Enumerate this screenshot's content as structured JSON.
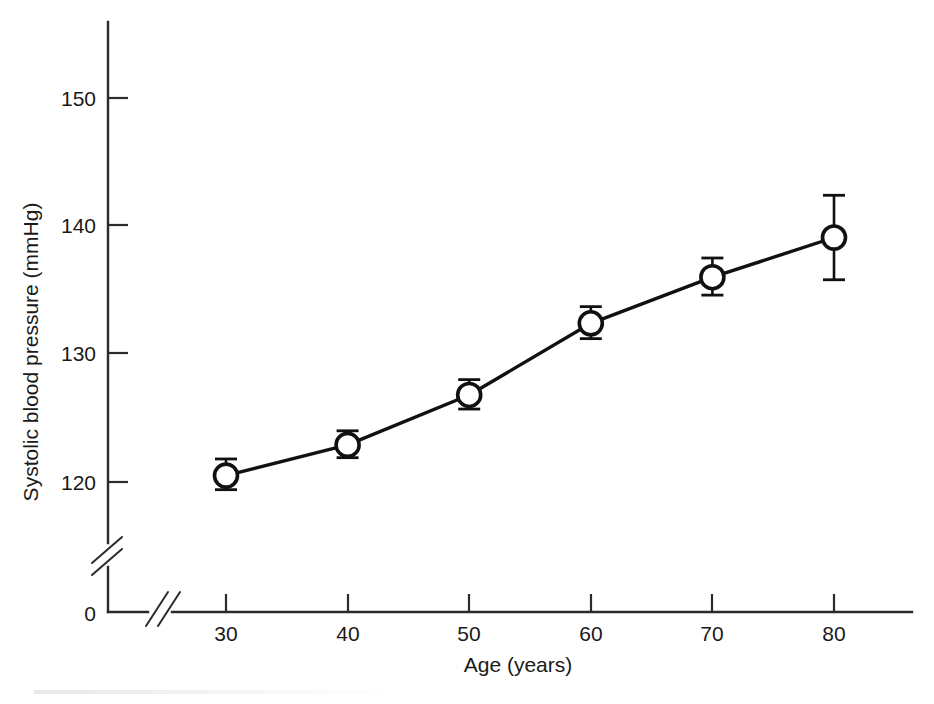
{
  "figure": {
    "background_color": "#ffffff",
    "ink_color": "#111111"
  },
  "chart_data": {
    "type": "line",
    "title": "",
    "subtitle": "",
    "xlabel": "Age (years)",
    "ylabel": "Systolic blood pressure (mmHg)",
    "x": [
      30,
      40,
      50,
      60,
      70,
      80
    ],
    "xtick_labels": [
      "30",
      "40",
      "50",
      "60",
      "70",
      "80"
    ],
    "ytick_labels": [
      "0",
      "120",
      "130",
      "140",
      "150"
    ],
    "yticks": [
      0,
      120,
      130,
      140,
      150
    ],
    "xlim": [
      25,
      85
    ],
    "ylim": [
      118,
      152
    ],
    "y_axis_break": true,
    "x_axis_break": true,
    "grid": false,
    "legend": null,
    "series": [
      {
        "name": "Systolic blood pressure",
        "marker": "open-circle",
        "values": [
          120.5,
          122.9,
          126.8,
          132.4,
          136.0,
          139.1
        ],
        "error_low": [
          119.4,
          121.9,
          125.7,
          131.2,
          134.6,
          135.8
        ],
        "error_high": [
          121.8,
          124.0,
          128.0,
          133.7,
          137.5,
          142.4
        ]
      }
    ],
    "annotations": []
  }
}
